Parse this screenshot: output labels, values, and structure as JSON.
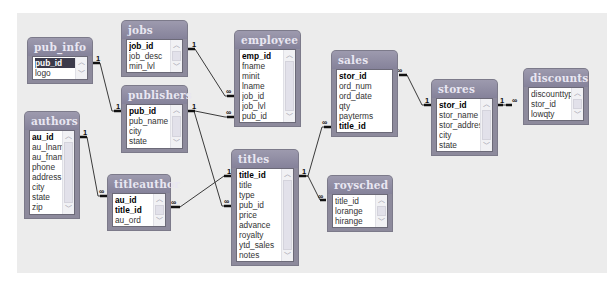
{
  "diagram": {
    "tables": [
      {
        "id": "pub_info",
        "title": "pub_info",
        "fields": [
          {
            "name": "pub_id",
            "key": true,
            "selected": true
          },
          {
            "name": "logo",
            "key": false
          }
        ]
      },
      {
        "id": "jobs",
        "title": "jobs",
        "fields": [
          {
            "name": "job_id",
            "key": true
          },
          {
            "name": "job_desc",
            "key": false
          },
          {
            "name": "min_lvl",
            "key": false
          }
        ]
      },
      {
        "id": "employee",
        "title": "employee",
        "fields": [
          {
            "name": "emp_id",
            "key": true
          },
          {
            "name": "fname",
            "key": false
          },
          {
            "name": "minit",
            "key": false
          },
          {
            "name": "lname",
            "key": false
          },
          {
            "name": "job_id",
            "key": false
          },
          {
            "name": "job_lvl",
            "key": false
          },
          {
            "name": "pub_id",
            "key": false
          }
        ]
      },
      {
        "id": "publishers",
        "title": "publishers",
        "fields": [
          {
            "name": "pub_id",
            "key": true
          },
          {
            "name": "pub_name",
            "key": false
          },
          {
            "name": "city",
            "key": false
          },
          {
            "name": "state",
            "key": false
          }
        ]
      },
      {
        "id": "authors",
        "title": "authors",
        "fields": [
          {
            "name": "au_id",
            "key": true
          },
          {
            "name": "au_lname",
            "key": false
          },
          {
            "name": "au_fname",
            "key": false
          },
          {
            "name": "phone",
            "key": false
          },
          {
            "name": "address",
            "key": false
          },
          {
            "name": "city",
            "key": false
          },
          {
            "name": "state",
            "key": false
          },
          {
            "name": "zip",
            "key": false
          }
        ]
      },
      {
        "id": "titleauthor",
        "title": "titleauthor",
        "fields": [
          {
            "name": "au_id",
            "key": true
          },
          {
            "name": "title_id",
            "key": true
          },
          {
            "name": "au_ord",
            "key": false
          }
        ]
      },
      {
        "id": "titles",
        "title": "titles",
        "fields": [
          {
            "name": "title_id",
            "key": true
          },
          {
            "name": "title",
            "key": false
          },
          {
            "name": "type",
            "key": false
          },
          {
            "name": "pub_id",
            "key": false
          },
          {
            "name": "price",
            "key": false
          },
          {
            "name": "advance",
            "key": false
          },
          {
            "name": "royalty",
            "key": false
          },
          {
            "name": "ytd_sales",
            "key": false
          },
          {
            "name": "notes",
            "key": false
          }
        ]
      },
      {
        "id": "sales",
        "title": "sales",
        "fields": [
          {
            "name": "stor_id",
            "key": true
          },
          {
            "name": "ord_num",
            "key": false
          },
          {
            "name": "ord_date",
            "key": false
          },
          {
            "name": "qty",
            "key": false
          },
          {
            "name": "payterms",
            "key": false
          },
          {
            "name": "title_id",
            "key": true
          }
        ]
      },
      {
        "id": "roysched",
        "title": "roysched",
        "fields": [
          {
            "name": "title_id",
            "key": false
          },
          {
            "name": "lorange",
            "key": false
          },
          {
            "name": "hirange",
            "key": false
          }
        ]
      },
      {
        "id": "stores",
        "title": "stores",
        "fields": [
          {
            "name": "stor_id",
            "key": true
          },
          {
            "name": "stor_name",
            "key": false
          },
          {
            "name": "stor_address",
            "key": false
          },
          {
            "name": "city",
            "key": false
          },
          {
            "name": "state",
            "key": false
          }
        ]
      },
      {
        "id": "discounts",
        "title": "discounts",
        "fields": [
          {
            "name": "discounttype",
            "key": false
          },
          {
            "name": "stor_id",
            "key": false
          },
          {
            "name": "lowqty",
            "key": false
          }
        ]
      }
    ],
    "relationship_markers": {
      "one": "1",
      "many": "∞"
    },
    "relationships": [
      {
        "from": "pub_info.pub_id",
        "to": "publishers.pub_id",
        "from_card": "1",
        "to_card": "1"
      },
      {
        "from": "jobs.job_id",
        "to": "employee.job_id",
        "from_card": "1",
        "to_card": "∞"
      },
      {
        "from": "publishers.pub_id",
        "to": "employee.pub_id",
        "from_card": "1",
        "to_card": "∞"
      },
      {
        "from": "publishers.pub_id",
        "to": "titles.pub_id",
        "from_card": "1",
        "to_card": "∞"
      },
      {
        "from": "authors.au_id",
        "to": "titleauthor.au_id",
        "from_card": "1",
        "to_card": "∞"
      },
      {
        "from": "titles.title_id",
        "to": "titleauthor.title_id",
        "from_card": "1",
        "to_card": "∞"
      },
      {
        "from": "titles.title_id",
        "to": "sales.title_id",
        "from_card": "1",
        "to_card": "∞"
      },
      {
        "from": "titles.title_id",
        "to": "roysched.title_id",
        "from_card": "1",
        "to_card": "∞"
      },
      {
        "from": "stores.stor_id",
        "to": "sales.stor_id",
        "from_card": "1",
        "to_card": "∞"
      },
      {
        "from": "stores.stor_id",
        "to": "discounts.stor_id",
        "from_card": "1",
        "to_card": "∞"
      }
    ],
    "scroll_up_glyph": "︿",
    "scroll_down_glyph": "﹀"
  }
}
